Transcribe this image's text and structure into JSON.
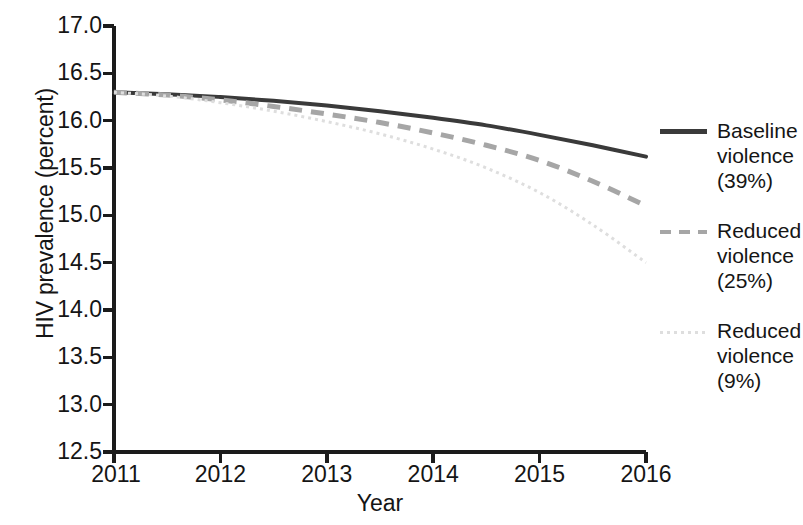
{
  "chart_data": {
    "type": "line",
    "title": "",
    "xlabel": "Year",
    "ylabel": "HIV prevalence (percent)",
    "xlim": [
      2011,
      2016
    ],
    "ylim": [
      12.5,
      17.0
    ],
    "grid": false,
    "legend_position": "right",
    "xticks": [
      "2011",
      "2012",
      "2013",
      "2014",
      "2015",
      "2016"
    ],
    "yticks": [
      "12.5",
      "13.0",
      "13.5",
      "14.0",
      "14.5",
      "15.0",
      "15.5",
      "16.0",
      "16.5",
      "17.0"
    ],
    "x": [
      2011,
      2011.5,
      2012,
      2012.5,
      2013,
      2013.5,
      2014,
      2014.5,
      2015,
      2015.5,
      2016
    ],
    "series": [
      {
        "name": "Baseline violence (39%)",
        "label_lines": "Baseline\nviolence\n(39%)",
        "style": "solid",
        "color": "#3a3a3a",
        "width": 4,
        "values": [
          16.3,
          16.28,
          16.25,
          16.21,
          16.16,
          16.1,
          16.03,
          15.95,
          15.85,
          15.74,
          15.62
        ]
      },
      {
        "name": "Reduced violence (25%)",
        "label_lines": "Reduced\nviolence\n(25%)",
        "style": "dashed",
        "color": "#a6a6a6",
        "width": 5,
        "values": [
          16.3,
          16.27,
          16.22,
          16.15,
          16.07,
          15.98,
          15.87,
          15.74,
          15.58,
          15.36,
          15.1
        ]
      },
      {
        "name": "Reduced violence (9%)",
        "label_lines": "Reduced\nviolence\n(9%)",
        "style": "dotted",
        "color": "#dedede",
        "width": 3,
        "values": [
          16.3,
          16.26,
          16.19,
          16.1,
          15.99,
          15.86,
          15.7,
          15.5,
          15.24,
          14.9,
          14.5
        ]
      }
    ]
  },
  "axes": {
    "line_color": "#1b1b1b",
    "tick_color": "#1b1b1b"
  }
}
